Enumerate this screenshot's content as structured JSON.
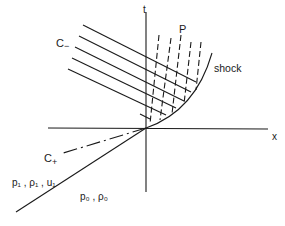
{
  "diagram": {
    "axes": {
      "x_label": "x",
      "t_label": "t"
    },
    "labels": {
      "c_minus": "C",
      "c_minus_sub": "−",
      "c_plus": "C",
      "c_plus_sub": "+",
      "point": "P",
      "shock": "shock",
      "region_upstream": "p₁ , ρ₁ , u₁",
      "region_ambient": "p₀ , ρ₀"
    },
    "colors": {
      "ink": "#1a1a1a",
      "background": "#ffffff"
    }
  }
}
